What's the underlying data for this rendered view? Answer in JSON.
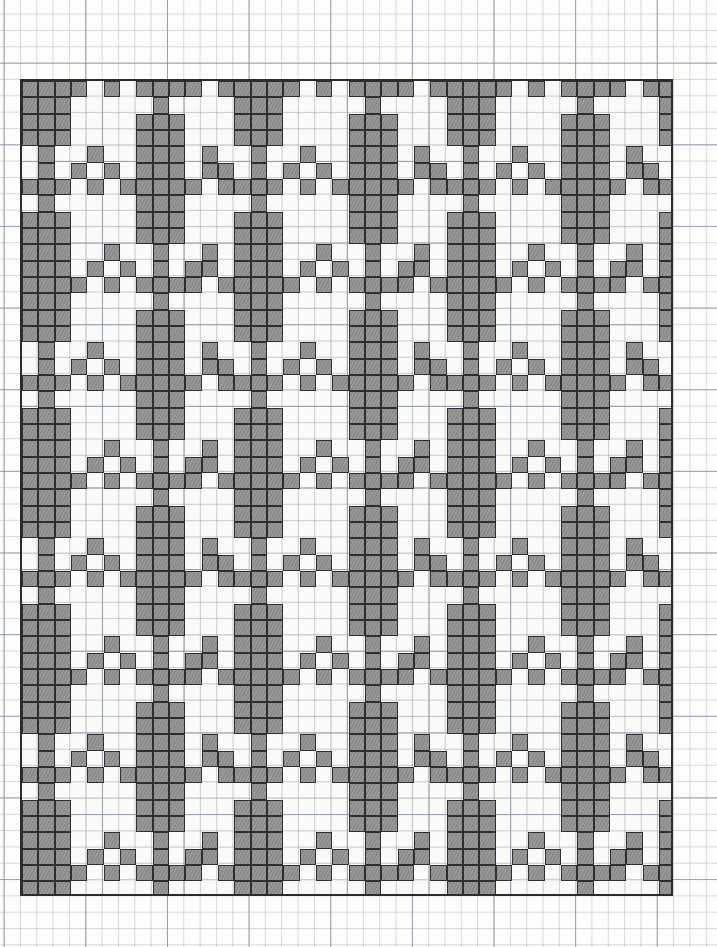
{
  "document": {
    "title": "Cross-stitch Pattern Chart",
    "description": "Hand-drawn counted cross-stitch / embroidery chart on graph paper showing a repeating stylized floral (tree-of-life) motif in staggered rows.",
    "medium": "pencil-on-graph-paper",
    "motif_name": "stylized-flower-motif"
  },
  "colors": {
    "paper": "#fdfdfb",
    "minor_gridline": "#96a0af",
    "major_gridline": "#6e7888",
    "design_border": "#2b2b2b",
    "stitch_fill": "#8d8d8d",
    "stitch_outline": "#2e2e2e"
  },
  "grid": {
    "columns": 40,
    "rows": 50,
    "cell_size_px": 16.33,
    "major_gridline_every": 5,
    "origin_x_px": 20,
    "origin_y_px": 79,
    "width_px": 653,
    "height_px": 817
  },
  "legend": {
    "filled_label": "stitched cell",
    "empty_label": "empty cell"
  },
  "motif": {
    "name": "flower",
    "width_cells": 9,
    "height_cells": 14,
    "offsets": [
      [
        3,
        0
      ],
      [
        4,
        0
      ],
      [
        5,
        0
      ],
      [
        3,
        1
      ],
      [
        4,
        1
      ],
      [
        5,
        1
      ],
      [
        3,
        2
      ],
      [
        4,
        2
      ],
      [
        5,
        2
      ],
      [
        1,
        3
      ],
      [
        3,
        3
      ],
      [
        4,
        3
      ],
      [
        5,
        3
      ],
      [
        7,
        3
      ],
      [
        0,
        4
      ],
      [
        2,
        4
      ],
      [
        3,
        4
      ],
      [
        4,
        4
      ],
      [
        5,
        4
      ],
      [
        6,
        4
      ],
      [
        8,
        4
      ],
      [
        3,
        5
      ],
      [
        4,
        5
      ],
      [
        5,
        5
      ],
      [
        3,
        6
      ],
      [
        4,
        6
      ],
      [
        5,
        6
      ],
      [
        3,
        7
      ],
      [
        4,
        7
      ],
      [
        5,
        7
      ],
      [
        1,
        8
      ],
      [
        4,
        8
      ],
      [
        7,
        8
      ],
      [
        2,
        9
      ],
      [
        4,
        9
      ],
      [
        6,
        9
      ],
      [
        3,
        10
      ],
      [
        4,
        10
      ],
      [
        5,
        10
      ],
      [
        4,
        11
      ],
      [
        4,
        12
      ],
      [
        4,
        13
      ]
    ]
  },
  "layout": {
    "description": "Motifs placed on a staggered lattice; column pitch 13 cells, row pitch 12 cells, alternate rows offset by 6-7 cells. Motifs are clipped at the chart border.",
    "column_pitch_cells": 13,
    "row_pitch_cells": 12,
    "placements": [
      {
        "col": -3,
        "row": -4
      },
      {
        "col": 4,
        "row": -10
      },
      {
        "col": 10,
        "row": -4
      },
      {
        "col": 17,
        "row": -10
      },
      {
        "col": 23,
        "row": -4
      },
      {
        "col": 30,
        "row": -10
      },
      {
        "col": 36,
        "row": -4
      },
      {
        "col": -3,
        "row": 8
      },
      {
        "col": 4,
        "row": 2
      },
      {
        "col": 10,
        "row": 8
      },
      {
        "col": 17,
        "row": 2
      },
      {
        "col": 23,
        "row": 8
      },
      {
        "col": 30,
        "row": 2
      },
      {
        "col": 36,
        "row": 8
      },
      {
        "col": -3,
        "row": 20
      },
      {
        "col": 4,
        "row": 14
      },
      {
        "col": 10,
        "row": 20
      },
      {
        "col": 17,
        "row": 14
      },
      {
        "col": 23,
        "row": 20
      },
      {
        "col": 30,
        "row": 14
      },
      {
        "col": 36,
        "row": 20
      },
      {
        "col": -3,
        "row": 32
      },
      {
        "col": 4,
        "row": 26
      },
      {
        "col": 10,
        "row": 32
      },
      {
        "col": 17,
        "row": 26
      },
      {
        "col": 23,
        "row": 32
      },
      {
        "col": 30,
        "row": 26
      },
      {
        "col": 36,
        "row": 32
      },
      {
        "col": -3,
        "row": 44
      },
      {
        "col": 4,
        "row": 38
      },
      {
        "col": 10,
        "row": 44
      },
      {
        "col": 17,
        "row": 38
      },
      {
        "col": 23,
        "row": 44
      },
      {
        "col": 30,
        "row": 38
      },
      {
        "col": 36,
        "row": 44
      },
      {
        "col": 4,
        "row": 50
      },
      {
        "col": 17,
        "row": 50
      },
      {
        "col": 30,
        "row": 50
      }
    ]
  }
}
